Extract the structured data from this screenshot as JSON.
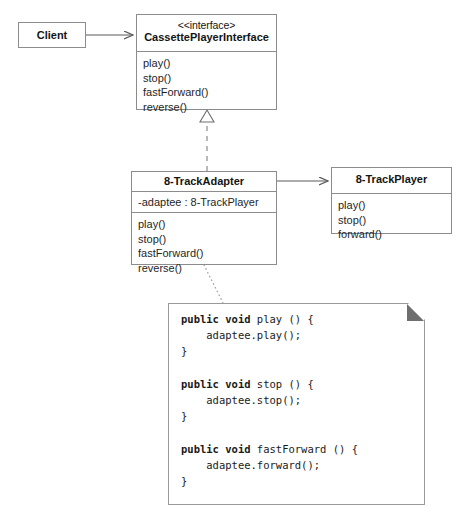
{
  "diagram": {
    "type": "uml-class-diagram",
    "background_color": "#ffffff",
    "border_color": "#8c8c8c",
    "text_color": "#1a1a1a",
    "note_fold_color": "#6e6e6e"
  },
  "classes": {
    "client": {
      "name": "Client",
      "stereotype": "",
      "attributes": [],
      "methods": []
    },
    "interface": {
      "stereotype": "<<interface>",
      "name": "CassettePlayerInterface",
      "attributes": [],
      "methods": [
        "play()",
        "stop()",
        "fastForward()",
        "reverse()"
      ]
    },
    "adapter": {
      "name": "8-TrackAdapter",
      "stereotype": "",
      "attributes": [
        "-adaptee : 8-TrackPlayer"
      ],
      "methods": [
        "play()",
        "stop()",
        "fastForward()",
        "reverse()"
      ]
    },
    "player": {
      "name": "8-TrackPlayer",
      "stereotype": "",
      "attributes": [],
      "methods": [
        "play()",
        "stop()",
        "forward()"
      ]
    }
  },
  "relationships": [
    {
      "id": "client-to-interface",
      "from": "Client",
      "to": "CassettePlayerInterface",
      "kind": "association",
      "line": "solid",
      "arrow": "open-arrow"
    },
    {
      "id": "adapter-to-interface",
      "from": "8-TrackAdapter",
      "to": "CassettePlayerInterface",
      "kind": "realization",
      "line": "dashed",
      "arrow": "hollow-triangle"
    },
    {
      "id": "adapter-to-player",
      "from": "8-TrackAdapter",
      "to": "8-TrackPlayer",
      "kind": "association",
      "line": "solid",
      "arrow": "open-arrow"
    },
    {
      "id": "adapter-to-note",
      "from": "8-TrackAdapter",
      "to": "code-note",
      "kind": "note-anchor",
      "line": "dotted",
      "arrow": "none"
    }
  ],
  "note": {
    "id": "code-note",
    "code": "public void play () {\n    adaptee.play();\n}\n\npublic void stop () {\n    adaptee.stop();\n}\n\npublic void fastForward () {\n    adaptee.forward();\n}\n\npublic void reverse () {\n    print \"Reverse not supported\";\n}",
    "keyword": "public void",
    "lines": [
      "public void play () {",
      "    adaptee.play();",
      "}",
      "",
      "public void stop () {",
      "    adaptee.stop();",
      "}",
      "",
      "public void fastForward () {",
      "    adaptee.forward();",
      "}",
      "",
      "public void reverse () {",
      "    print \"Reverse not supported\";",
      "}"
    ]
  }
}
